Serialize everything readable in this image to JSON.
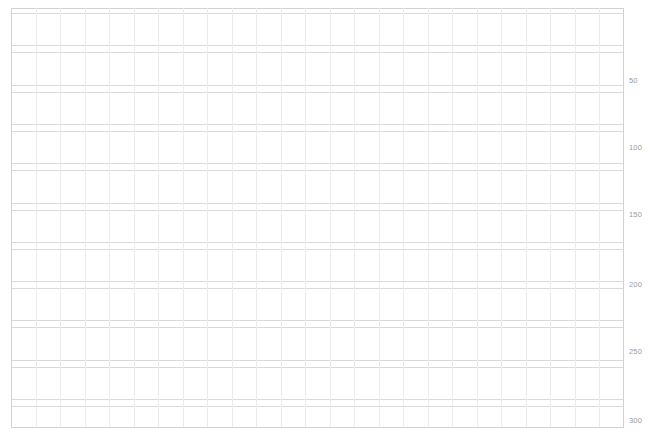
{
  "canvas": {
    "width": 651,
    "height": 441,
    "background": "#ffffff"
  },
  "plot": {
    "name": "grid-sheet",
    "left": 11,
    "top": 8,
    "width": 613,
    "height": 420,
    "line_color": "#d9d9d9",
    "line_color_faint": "#ebebeb",
    "border_color": "#d2d2d2"
  },
  "chart_data": {
    "type": "table",
    "title": "",
    "subtitle": "",
    "xlabel": "",
    "ylabel": "",
    "grid": true,
    "legend": null,
    "annotations": [],
    "columns": 25,
    "rows": 13,
    "column_width_px": 24.5,
    "row_band_height_px": 32.3,
    "row_gap_px": 7.0,
    "y_axis": {
      "position": "right",
      "ylim": [
        0,
        325
      ],
      "tick_values": [
        50,
        100,
        150,
        200,
        250,
        300
      ],
      "tick_labels": [
        "50",
        "100",
        "150",
        "200",
        "250",
        "300"
      ],
      "tick_y_px": [
        81,
        148,
        215,
        285,
        352,
        421
      ],
      "label_color": "#9a9a9a",
      "label_font_size_px": 7.5
    },
    "x_axis": {
      "tick_labels": [],
      "visible_ticks": false
    },
    "series": [],
    "values": []
  },
  "axis": {
    "ticks": [
      {
        "label": "50",
        "y": 77
      },
      {
        "label": "100",
        "y": 144
      },
      {
        "label": "150",
        "y": 211
      },
      {
        "label": "200",
        "y": 281
      },
      {
        "label": "250",
        "y": 348
      },
      {
        "label": "300",
        "y": 417
      }
    ],
    "x": 629
  }
}
